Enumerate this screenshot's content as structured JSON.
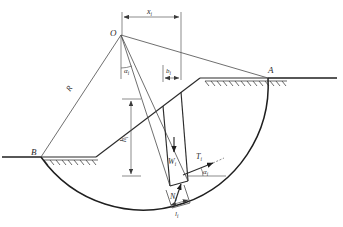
{
  "figure": {
    "type": "engineering-diagram"
  },
  "colors": {
    "line": "#2b2b2b",
    "arc": "#1f1f1f",
    "ground": "#1f1f1f",
    "dimension": "#5a5a5a",
    "hatch": "#3a3a3a",
    "background": "#ffffff"
  },
  "labels": {
    "center_point": "O",
    "toe_point": "B",
    "crest_point": "A",
    "radius": "R",
    "moment_arm": "x",
    "moment_arm_sub": "i",
    "slice_width": "b",
    "slice_width_sub": "i",
    "slice_height": "h",
    "slice_height_sub": "i",
    "weight": "W",
    "weight_sub": "i",
    "tangential_force": "T",
    "tangential_force_sub": "i",
    "normal_force": "N",
    "normal_force_sub": "i",
    "base_length": "l",
    "base_length_sub": "i",
    "angle_at_center": "α",
    "angle_at_center_sub": "i",
    "angle_at_base": "α",
    "angle_at_base_sub": "i"
  },
  "geometry": {
    "center": {
      "x": 121,
      "y": 35
    },
    "toe_B": {
      "x": 41,
      "y": 157
    },
    "crest_A": {
      "x": 268,
      "y": 78
    },
    "slope_crest_left": {
      "x": 200,
      "y": 78
    },
    "left_ground_y": 157,
    "right_ground_y": 78,
    "left_ground_x_start": 2,
    "right_ground_x_end": 337,
    "slice_left_x": 163,
    "slice_right_x": 181,
    "dim_x_start": 122,
    "dim_x_end": 181,
    "dim_x_y": 17,
    "dim_b_y": 78,
    "dim_h_x": 131,
    "dim_h_top_y": 99,
    "dim_h_bottom_y": 176,
    "radius_value": 125
  }
}
